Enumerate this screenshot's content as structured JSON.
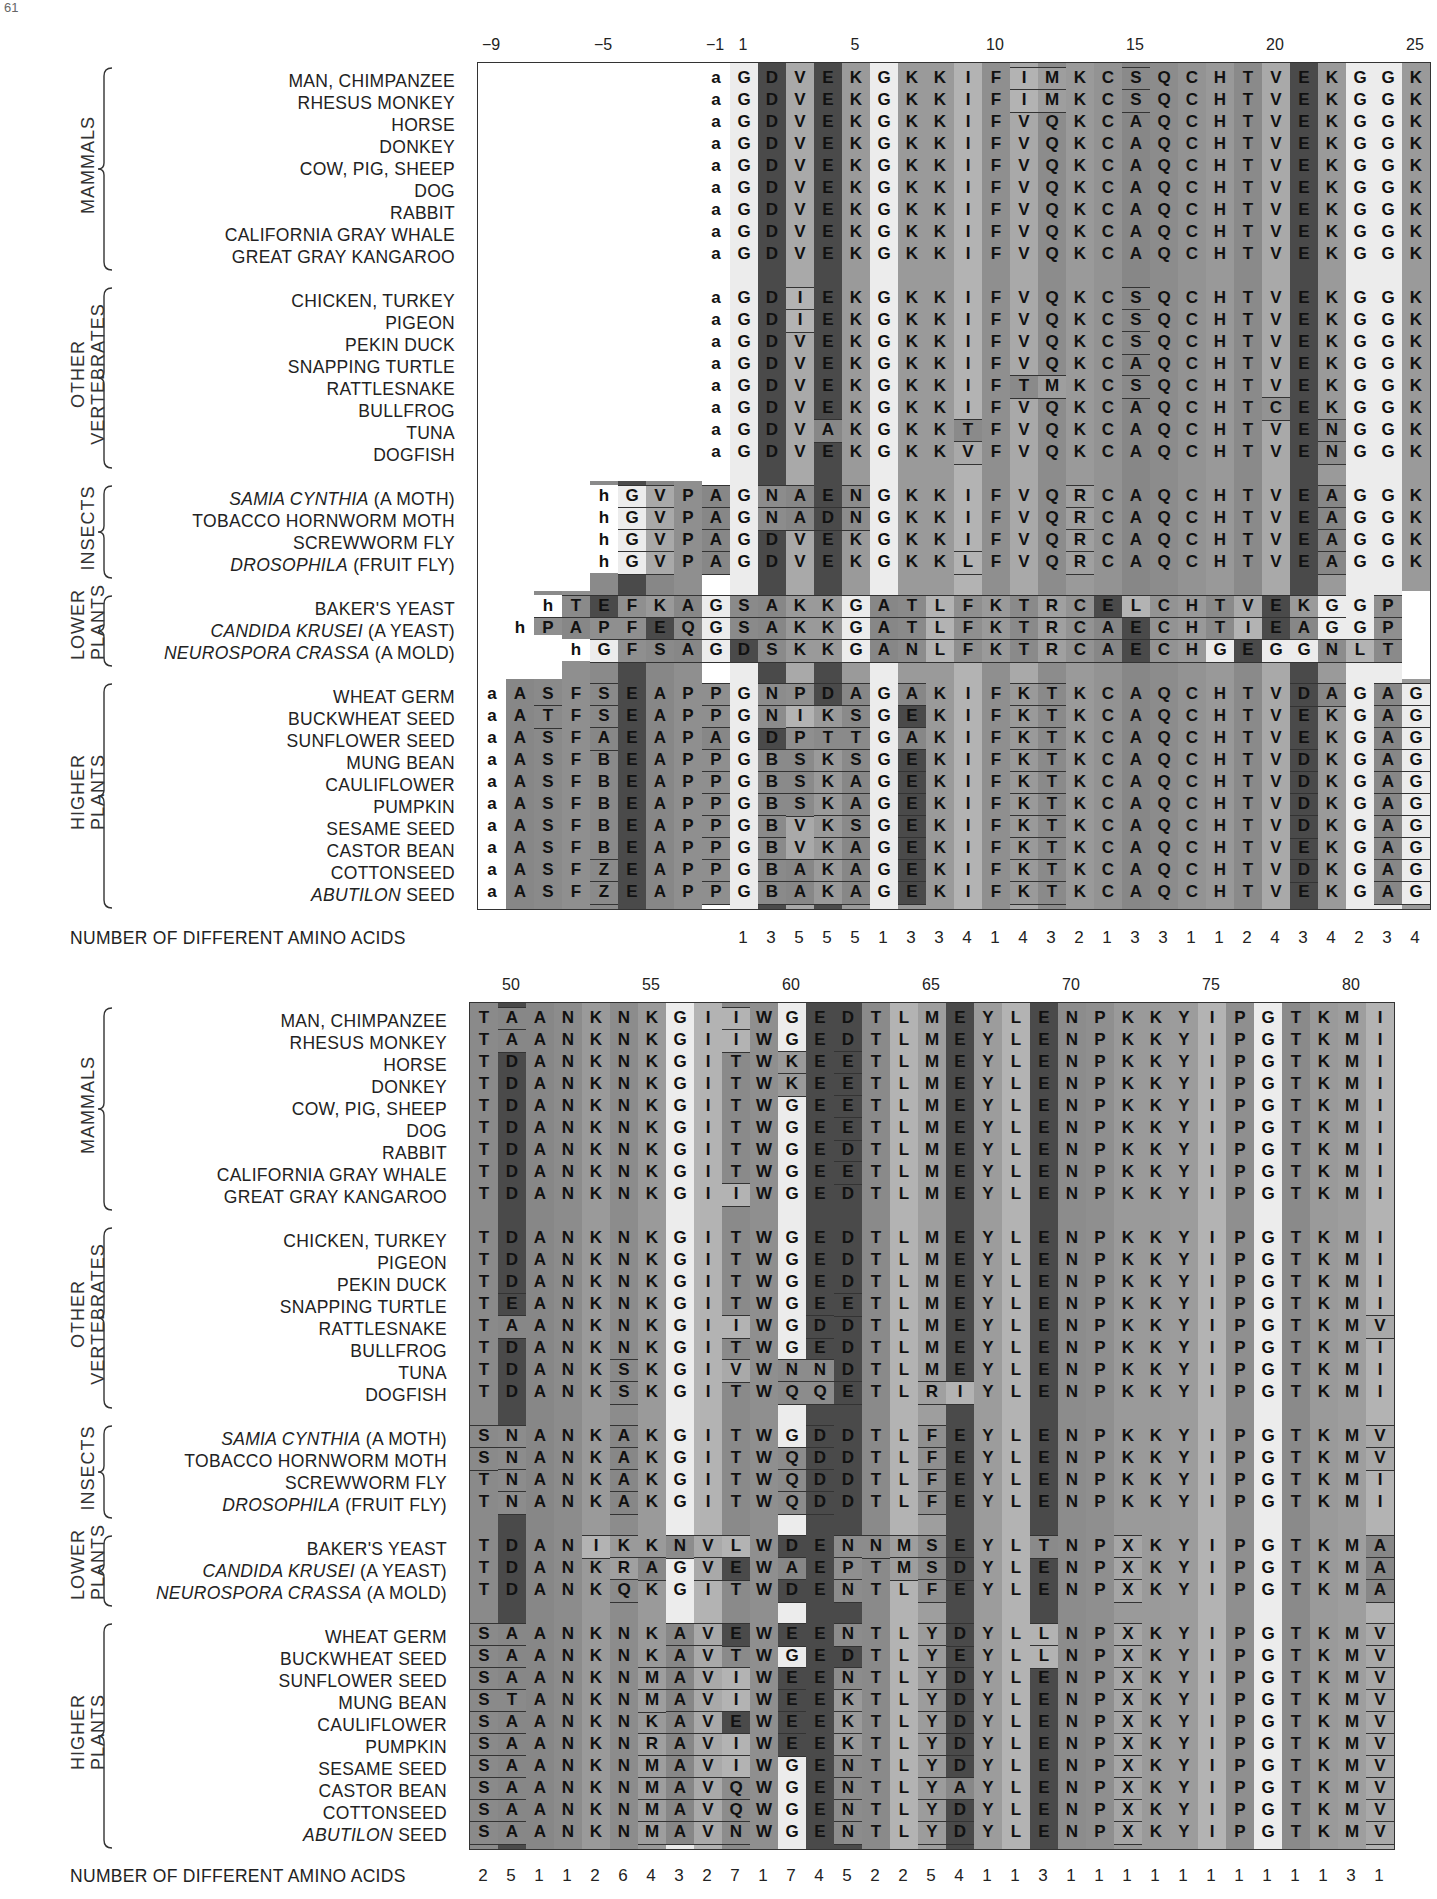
{
  "page_number": "61",
  "top_panel": {
    "position_ticks": [
      {
        "label": "−9",
        "col": 0
      },
      {
        "label": "−5",
        "col": 4
      },
      {
        "label": "−1",
        "col": 8
      },
      {
        "label": "1",
        "col": 9
      },
      {
        "label": "5",
        "col": 13
      },
      {
        "label": "10",
        "col": 18
      },
      {
        "label": "15",
        "col": 23
      },
      {
        "label": "20",
        "col": 28
      },
      {
        "label": "25",
        "col": 33
      }
    ],
    "count_label": "NUMBER OF DIFFERENT AMINO ACIDS",
    "counts": [
      "",
      "",
      "",
      "",
      "",
      "",
      "",
      "",
      "",
      "1",
      "3",
      "5",
      "5",
      "5",
      "1",
      "3",
      "3",
      "4",
      "1",
      "4",
      "3",
      "2",
      "1",
      "3",
      "3",
      "1",
      "1",
      "2",
      "4",
      "3",
      "4",
      "2",
      "3",
      "4"
    ]
  },
  "bottom_panel": {
    "position_ticks": [
      {
        "label": "50",
        "col": 1
      },
      {
        "label": "55",
        "col": 6
      },
      {
        "label": "60",
        "col": 11
      },
      {
        "label": "65",
        "col": 16
      },
      {
        "label": "70",
        "col": 21
      },
      {
        "label": "75",
        "col": 26
      },
      {
        "label": "80",
        "col": 31
      }
    ],
    "count_label": "NUMBER OF DIFFERENT AMINO ACIDS",
    "counts": [
      "2",
      "5",
      "1",
      "1",
      "2",
      "6",
      "4",
      "3",
      "2",
      "7",
      "1",
      "7",
      "4",
      "5",
      "2",
      "2",
      "5",
      "4",
      "1",
      "1",
      "3",
      "1",
      "1",
      "1",
      "1",
      "1",
      "1",
      "1",
      "1",
      "1",
      "1",
      "3",
      "1"
    ]
  },
  "groups": [
    {
      "name": "MAMMALS",
      "species": [
        "MAN, CHIMPANZEE",
        "RHESUS MONKEY",
        "HORSE",
        "DONKEY",
        "COW, PIG, SHEEP",
        "DOG",
        "RABBIT",
        "CALIFORNIA GRAY WHALE",
        "GREAT GRAY KANGAROO"
      ]
    },
    {
      "name": "OTHER VERTEBRATES",
      "species": [
        "CHICKEN, TURKEY",
        "PIGEON",
        "PEKIN DUCK",
        "SNAPPING TURTLE",
        "RATTLESNAKE",
        "BULLFROG",
        "TUNA",
        "DOGFISH"
      ]
    },
    {
      "name": "INSECTS",
      "species": [
        "SAMIA CYNTHIA (A MOTH)",
        "TOBACCO HORNWORM MOTH",
        "SCREWWORM FLY",
        "DROSOPHILA (FRUIT FLY)"
      ]
    },
    {
      "name": "LOWER PLANTS",
      "species": [
        "BAKER'S YEAST",
        "CANDIDA KRUSEI (A YEAST)",
        "NEUROSPORA CRASSA (A MOLD)"
      ]
    },
    {
      "name": "HIGHER PLANTS",
      "species": [
        "WHEAT GERM",
        "BUCKWHEAT SEED",
        "SUNFLOWER SEED",
        "MUNG BEAN",
        "CAULIFLOWER",
        "PUMPKIN",
        "SESAME SEED",
        "CASTOR BEAN",
        "COTTONSEED",
        "ABUTILON SEED"
      ]
    }
  ],
  "italic_species": [
    "SAMIA CYNTHIA",
    "DROSOPHILA",
    "CANDIDA KRUSEI",
    "NEUROSPORA CRASSA",
    "ABUTILON"
  ],
  "chart_data": {
    "type": "table",
    "top_columns": "positions -9..-1, 1..25",
    "top_sequences": [
      "        aGDVEKGKKIFIMKCSQCHTVEKGGK",
      "        aGDVEKGKKIFIMKCSQCHTVEKGGK",
      "        aGDVEKGKKIFVQKCAQCHTVEKGGK",
      "        aGDVEKGKKIFVQKCAQCHTVEKGGK",
      "        aGDVEKGKKIFVQKCAQCHTVEKGGK",
      "        aGDVEKGKKIFVQKCAQCHTVEKGGK",
      "        aGDVEKGKKIFVQKCAQCHTVEKGGK",
      "        aGDVEKGKKIFVQKCAQCHTVEKGGK",
      "        aGDVEKGKKIFVQKCAQCHTVEKGGK",
      "        aGDIEKGKKIFVQKCSQCHTVEKGGK",
      "        aGDIEKGKKIFVQKCSQCHTVEKGGK",
      "        aGDVEKGKKIFVQKCSQCHTVEKGGK",
      "        aGDVEKGKKIFVQKCAQCHTVEKGGK",
      "        aGDVEKGKKIFTMKCSQCHTVEKGGK",
      "        aGDVEKGKKIFVQKCAQCHTCEKGGK",
      "        aGDVAKGKKTFVQKCAQCHTVENGGK",
      "        aGDVEKGKKVFVQKCAQCHTVENGGK",
      "    hGVPAGNAENGKKIFVQRCAQCHTVEAGGK",
      "    hGVPAGNADNGKKIFVQRCAQCHTVEAGGK",
      "    hGVPAGDVEKGKKIFVQRCAQCHTVEAGGK",
      "    hGVPAGDVEKGKKLFVQRCAQCHTVEAGGK",
      "  hTEFKAGSAKKGATLFKTRCELCHTVEKGGP",
      " hPAPFEQGSAKKGATLFKTRCAECHTIEAGGP",
      "   hGFSAGDSKKGANLFKTRCAECHGEGGNLT",
      "aASFSEAPPGNPDAGAKIFKTKCAQCHTVDAGAG",
      "aATFSEAPPGNIKSGEKIFKTKCAQCHTVEKGAG",
      "aASFAEAPAGDPTTGAKIFKTKCAQCHTVEKGAG",
      "aASFBEAPPGBSKSGEKIFKTKCAQCHTVDKGAG",
      "aASFBEAPPGBSKAGEKIFKTKCAQCHTVDKGAG",
      "aASFBEAPPGBSKAGEKIFKTKCAQCHTVDKGAG",
      "aASFBEAPPGBVKSGEKIFKTKCAQCHTVDKGAG",
      "aASFBEAPPGBVKAGEKIFKTKCAQCHTVEKGAG",
      "aASFZEAPPGBAKAGEKIFKTKCAQCHTVDKGAG",
      "aASFZEAPPGBAKAGEKIFKTKCAQCHTVEKGAG"
    ],
    "bottom_columns": "positions 49..81",
    "bottom_sequences": [
      "TAANKNKGIIWGEDTLMEYLENPKKYIPGTKMIF",
      "TAANKNKGIIWGEDTLMEYLENPKKYIPGTKMIF",
      "TDANKNKGITWKEETLMEYLENPKKYIPGTKMIF",
      "TDANKNKGITWKEETLMEYLENPKKYIPGTKMIF",
      "TDANKNKGITWGEETLMEYLENPKKYIPGTKMIF",
      "TDANKNKGITWGEETLMEYLENPKKYIPGTKMIF",
      "TDANKNKGITWGEDTLMEYLENPKKYIPGTKMIF",
      "TDANKNKGITWGEETLMEYLENPKKYIPGTKMIF",
      "TDANKNKGIIWGEDTLMEYLENPKKYIPGTKMIF",
      "TDANKNKGITWGEDTLMEYLENPKKYIPGTKMIF",
      "TDANKNKGITWGEDTLMEYLENPKKYIPGTKMIF",
      "TDANKNKGITWGEDTLMEYLENPKKYIPGTKMIF",
      "TEANKNKGITWGEETLMEYLENPKKYIPGTKMIF",
      "TAANKNKGIIWGDDTLMEYLENPKKYIPGTKMVF",
      "TDANKNKGITWGEDTLMEYLENPKKYIPGTKMIF",
      "TDANKSKGIVWNNDTLMEYLENPKKYIPGTKMIF",
      "TDANKSKGITWQQETLRIYLENPKKYIPGTKMIF",
      "SNANKAKGITWGDDTLFEYLENPKKYIPGTKMVF",
      "SNANKAKGITWQDDTLFEYLENPKKYIPGTKMVF",
      "TNANKAKGITWQDDTLFEYLENPKKYIPGTKMIF",
      "TNANKAKGITWQDDTLFEYLENPKKYIPGTKMIF",
      "TDANIKKNVLWDENNMSEYLTNPXKYIPGTKMAF",
      "TDANKRAGVEWAEPTMSDYLENPXKYIPGTKMAF",
      "TDANKQKGITWDENTLFEYLENPXKYIPGTKMAF",
      "SAANKNKAVEWEENTLYDYLLNPXKYIPGTKMVF",
      "SAANKNKAVTWGEDTLYEYLLNPXKYIPGTKMVF",
      "SAANKNMAVIWEENTLYDYLENPXKYIPGTKMVF",
      "STANKNMAVIWEEKTLYDYLENPXKYIPGTKMVF",
      "SAANKNKAVEWEEKTLYDYLENPXKYIPGTKMVF",
      "SAANKNRAVIWEEKTLYDYLENPXKYIPGTKMVF",
      "SAANKNMAVIWGENTLYDYLENPXKYIPGTKMVF",
      "SAANKNMAVQWGENTLYAYLENPXKYIPGTKMVF",
      "SAANKNMAVQWGENTLYDYLENPXKYIPGTKMVF",
      "SAANKNMAVNWGENTLYDYLENPXKYIPGTKMVF"
    ]
  }
}
